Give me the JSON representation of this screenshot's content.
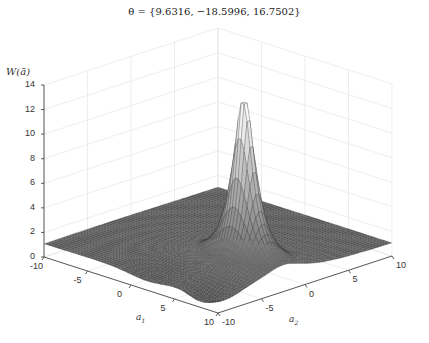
{
  "chart_data": {
    "type": "surface3d",
    "title": "θ = {9.6316, −18.5996, 16.7502}",
    "zlabel": "W(ā)",
    "xlabel": "a₁",
    "ylabel": "a₂",
    "x_ticks": [
      "-10",
      "-5",
      "0",
      "5",
      "10"
    ],
    "y_ticks": [
      "-10",
      "-5",
      "0",
      "5",
      "10"
    ],
    "z_ticks": [
      "0",
      "2",
      "4",
      "6",
      "8",
      "10",
      "12",
      "14"
    ],
    "xlim": [
      -10,
      10
    ],
    "ylim": [
      -10,
      10
    ],
    "zlim": [
      0,
      14
    ],
    "grid": true,
    "surface": {
      "description": "Sharp peak ~15 near a1≈5, a2≈-3 along a ridge; near-flat base ~1 elsewhere with a shallow trough",
      "peak_value": 15,
      "peak_location": [
        5,
        -3
      ],
      "base_level": 1,
      "colormap": "gray"
    },
    "theta": [
      9.6316,
      -18.5996,
      16.7502
    ]
  },
  "labels": {
    "title": "θ = {9.6316, −18.5996, 16.7502}",
    "zlabel": "W(ā)",
    "a1": "a",
    "a1_sub": "1",
    "a2": "a",
    "a2_sub": "2"
  }
}
